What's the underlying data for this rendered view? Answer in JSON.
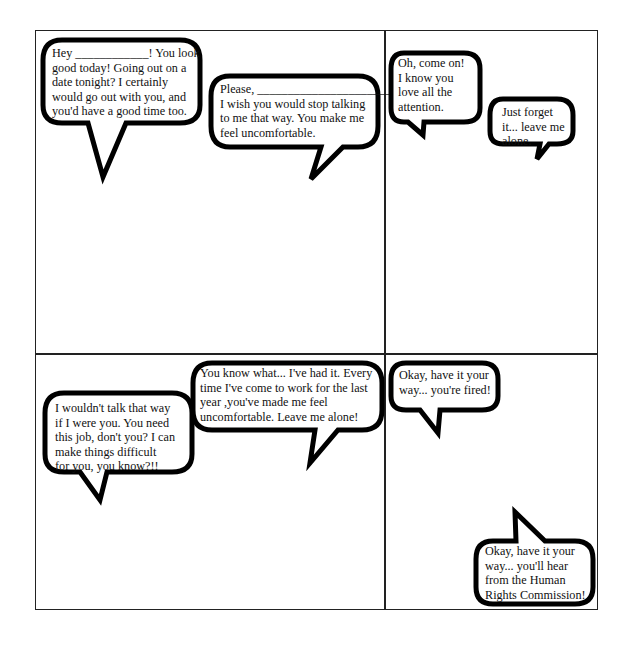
{
  "comic": {
    "panels": [
      {
        "id": "panel-1",
        "bubbles": [
          {
            "text": "Hey ____________! You look\ngood today! Going out on a\ndate tonight? I certainly\nwould go out with you, and\nyou'd have a good time too."
          },
          {
            "text": "Please, ______________________,\nI wish you would stop talking\nto me that way. You make me\nfeel uncomfortable."
          }
        ]
      },
      {
        "id": "panel-2",
        "bubbles": [
          {
            "text": "Oh, come on!\nI know you\nlove all the\nattention."
          },
          {
            "text": "Just forget\nit... leave me\nalone."
          }
        ]
      },
      {
        "id": "panel-3",
        "bubbles": [
          {
            "text": "I wouldn't talk that way\nif I were you. You need\nthis job, don't you? I can\nmake things difficult\nfor you, you know?!!"
          },
          {
            "text": "You know what... I've had it. Every\ntime I've come to work for the last\nyear ,you've made me feel\nuncomfortable. Leave me alone!"
          }
        ]
      },
      {
        "id": "panel-4",
        "bubbles": [
          {
            "text": "Okay, have it your\nway... you're fired!"
          },
          {
            "text": "Okay, have it your\nway... you'll hear\nfrom the Human\nRights Commission!"
          }
        ]
      }
    ]
  }
}
